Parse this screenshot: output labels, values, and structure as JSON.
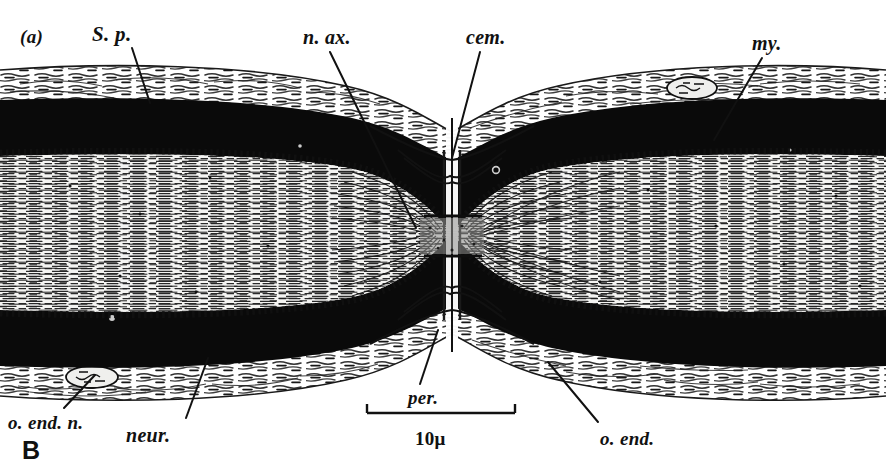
{
  "figure": {
    "panel_letter": "(a)",
    "plate_letter": "B",
    "scale_bar": {
      "label": "10μ",
      "x_start": 367,
      "x_end": 515,
      "y": 413
    },
    "colors": {
      "ink": "#111111",
      "myelin_dark": "#0b0b0b",
      "paper": "#ffffff",
      "axoplasm_light": "#f2f2f0",
      "sheath_grey": "#555555"
    }
  },
  "annotations": [
    {
      "key": "s_p",
      "text": "S. p.",
      "x": 92,
      "y": 22,
      "leader": {
        "x1": 132,
        "y1": 48,
        "x2": 150,
        "y2": 103
      }
    },
    {
      "key": "n_ax",
      "text": "n. ax.",
      "x": 303,
      "y": 26,
      "leader": {
        "x1": 330,
        "y1": 52,
        "x2": 416,
        "y2": 228
      }
    },
    {
      "key": "cem",
      "text": "cem.",
      "x": 466,
      "y": 26,
      "leader": {
        "x1": 480,
        "y1": 52,
        "x2": 452,
        "y2": 158
      }
    },
    {
      "key": "my",
      "text": "my.",
      "x": 752,
      "y": 32,
      "leader": {
        "x1": 762,
        "y1": 58,
        "x2": 714,
        "y2": 140
      }
    },
    {
      "key": "o_end_n",
      "text": "o. end. n.",
      "x": 8,
      "y": 412,
      "leader": {
        "x1": 64,
        "y1": 408,
        "x2": 95,
        "y2": 375
      }
    },
    {
      "key": "neur",
      "text": "neur.",
      "x": 126,
      "y": 424,
      "leader": {
        "x1": 186,
        "y1": 418,
        "x2": 208,
        "y2": 358
      }
    },
    {
      "key": "per",
      "text": "per.",
      "x": 408,
      "y": 387,
      "leader": {
        "x1": 420,
        "y1": 384,
        "x2": 438,
        "y2": 330
      }
    },
    {
      "key": "o_end",
      "text": "o. end.",
      "x": 600,
      "y": 428,
      "leader": {
        "x1": 598,
        "y1": 422,
        "x2": 548,
        "y2": 362
      }
    }
  ],
  "structures": {
    "myelin_band_top": {
      "y_top": 100,
      "y_bottom": 155
    },
    "axoplasm_band": {
      "y_top": 155,
      "y_bottom": 300
    },
    "myelin_band_bottom": {
      "y_top": 300,
      "y_bottom": 365
    },
    "node_center_x": 452,
    "nuclei": [
      {
        "name": "schwann-nucleus-upper-right",
        "cx": 692,
        "cy": 88,
        "rx": 25,
        "ry": 11
      },
      {
        "name": "endoneurial-nucleus-lower-left",
        "cx": 92,
        "cy": 377,
        "rx": 26,
        "ry": 11
      }
    ]
  }
}
